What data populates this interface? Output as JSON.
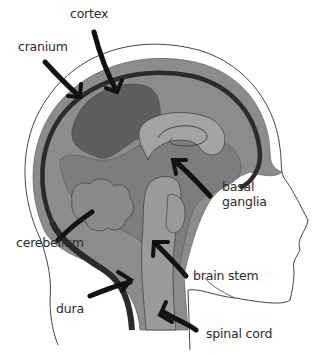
{
  "diagram": {
    "labels": {
      "cortex": "cortex",
      "cranium": "cranium",
      "basal_ganglia_line1": "basal",
      "basal_ganglia_line2": "ganglia",
      "cerebellum": "cerebellum",
      "brain_stem": "brain stem",
      "dura": "dura",
      "spinal_cord": "spinal cord"
    },
    "colors": {
      "background": "#ffffff",
      "outer_tissue": "#8c8c8c",
      "dura_band": "#2b2b2b",
      "cortex_region": "#5e5e5e",
      "inner_brain": "#7d7d7d",
      "light_structures": "#a3a3a3",
      "arrow": "#111111",
      "outline": "#333333"
    }
  }
}
